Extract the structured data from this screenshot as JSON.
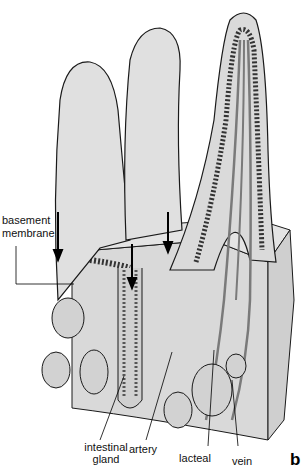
{
  "figure": {
    "panel_letter": "b",
    "colors": {
      "background": "#ffffff",
      "tissue_fill": "#dcdcdc",
      "tissue_light": "#e6e6e6",
      "outline": "#1a1a1a",
      "vessel": "#7a7a7a",
      "cell_fill": "#d0d0d0"
    }
  },
  "labels": {
    "basement_membrane_1": "basement",
    "basement_membrane_2": "membrane",
    "intestinal_gland_1": "intestinal",
    "intestinal_gland_2": "gland",
    "artery": "artery",
    "lacteal": "lacteal",
    "vein": "vein"
  }
}
